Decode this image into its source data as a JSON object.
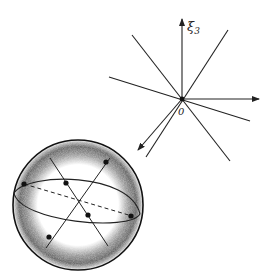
{
  "figure": {
    "axis_label": "ξ",
    "axis_subscript": "3",
    "origin_label": "0",
    "colors": {
      "ink": "#222222",
      "background": "#ffffff",
      "shading": "#555555"
    }
  }
}
